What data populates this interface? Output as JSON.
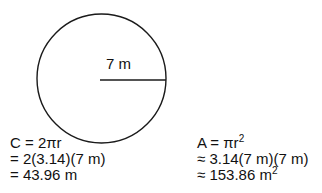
{
  "diagram": {
    "shape": "circle",
    "radius_label": "7 m",
    "stroke_color": "#1a1a1a",
    "background": "#ffffff"
  },
  "circumference": {
    "lines": [
      {
        "text": "C = 2πr"
      },
      {
        "text": "= 2(3.14)(7 m)"
      },
      {
        "text": "= 43.96 m"
      }
    ]
  },
  "area": {
    "lines": [
      {
        "text": "A = πr",
        "sup": "2"
      },
      {
        "text": "≈ 3.14(7 m)(7 m)"
      },
      {
        "text": "≈ 153.86 m",
        "sup": "2"
      }
    ]
  }
}
